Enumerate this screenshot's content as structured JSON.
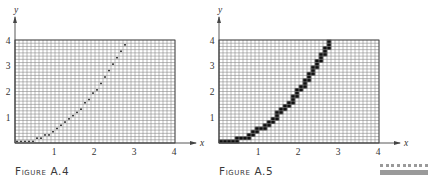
{
  "chart_data": [
    {
      "type": "line",
      "id": "figure-a4",
      "title": "FIGURE A.4",
      "function": "y = x^2 / 2",
      "rendering": "rasterized as dots at pixel-grid cell centers",
      "grid": {
        "columns": 40,
        "rows": 32,
        "x_step": 0.1,
        "y_step": 0.125
      },
      "xlabel": "x",
      "ylabel": "y",
      "xlim": [
        0,
        4
      ],
      "ylim": [
        0,
        4
      ],
      "x_ticks": [
        "1",
        "2",
        "3",
        "4"
      ],
      "y_ticks": [
        "1",
        "2",
        "3",
        "4"
      ],
      "grid_on": true,
      "x": [
        0,
        0.5,
        1,
        1.5,
        2,
        2.5,
        2.83
      ],
      "y": [
        0,
        0.125,
        0.5,
        1.125,
        2,
        3.125,
        4
      ]
    },
    {
      "type": "line",
      "id": "figure-a5",
      "title": "FIGURE A.5",
      "function": "y = x^2 / 2",
      "rendering": "rasterized as filled black grid cells (thick staircase)",
      "grid": {
        "columns": 40,
        "rows": 32,
        "x_step": 0.1,
        "y_step": 0.125
      },
      "xlabel": "x",
      "ylabel": "y",
      "xlim": [
        0,
        4
      ],
      "ylim": [
        0,
        4
      ],
      "x_ticks": [
        "1",
        "2",
        "3",
        "4"
      ],
      "y_ticks": [
        "1",
        "2",
        "3",
        "4"
      ],
      "grid_on": true,
      "x": [
        0,
        0.5,
        1,
        1.5,
        2,
        2.5,
        2.83
      ],
      "y": [
        0,
        0.125,
        0.5,
        1.125,
        2,
        3.125,
        4
      ]
    }
  ],
  "figures": {
    "a4": {
      "caption": "Figure A.4",
      "xlabel": "x",
      "ylabel": "y",
      "x_ticks": [
        "1",
        "2",
        "3",
        "4"
      ],
      "y_ticks": [
        "1",
        "2",
        "3",
        "4"
      ]
    },
    "a5": {
      "caption": "Figure A.5",
      "xlabel": "x",
      "ylabel": "y",
      "x_ticks": [
        "1",
        "2",
        "3",
        "4"
      ],
      "y_ticks": [
        "1",
        "2",
        "3",
        "4"
      ]
    }
  },
  "colors": {
    "grid": "#8a8a8a",
    "axis": "#444444",
    "curve": "#111111",
    "decor": "#9a9a9a"
  }
}
